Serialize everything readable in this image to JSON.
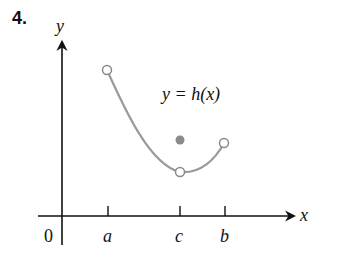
{
  "problem_number": "4.",
  "axes": {
    "y_label": "y",
    "x_label": "x",
    "origin_label": "0"
  },
  "ticks": [
    {
      "label": "a",
      "x": 108
    },
    {
      "label": "c",
      "x": 180
    },
    {
      "label": "b",
      "x": 225
    }
  ],
  "function_label": "y = h(x)",
  "points": {
    "left_open": {
      "x": 107,
      "y": 70,
      "type": "open"
    },
    "min_open": {
      "x": 180,
      "y": 172,
      "type": "open"
    },
    "right_open": {
      "x": 224,
      "y": 143,
      "type": "open"
    },
    "filled": {
      "x": 180,
      "y": 140,
      "type": "filled"
    }
  },
  "colors": {
    "curve": "#9a9a9a",
    "axis": "#111111",
    "filled_dot": "#8a8a8a"
  }
}
